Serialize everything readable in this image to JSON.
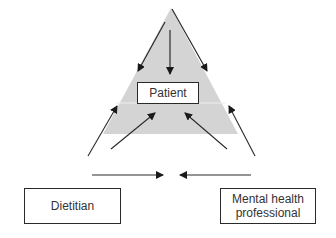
{
  "diagram": {
    "type": "triangle-team-model",
    "colors": {
      "triangle_fill": "#d4d4d4",
      "line": "#2a2a2a",
      "box_border": "#2a2a2a",
      "text": "#333333"
    },
    "nodes": {
      "patient": "Patient",
      "dietitian": "Dietitian",
      "mental_health": "Mental health professional"
    },
    "arrows": [
      {
        "from": "apex",
        "to": "patient",
        "label": ""
      },
      {
        "from": "apex-left-edge",
        "to": "patient",
        "label": ""
      },
      {
        "from": "apex-right-edge",
        "to": "patient",
        "label": ""
      },
      {
        "from": "dietitian",
        "to": "patient",
        "label": ""
      },
      {
        "from": "mental_health",
        "to": "patient",
        "label": ""
      },
      {
        "from": "dietitian",
        "to": "mental_health",
        "label": ""
      },
      {
        "from": "mental_health",
        "to": "dietitian",
        "label": ""
      }
    ]
  }
}
